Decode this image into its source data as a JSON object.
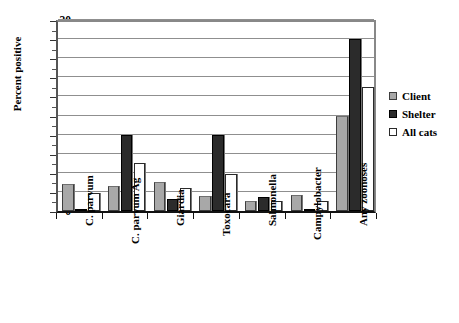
{
  "chart_data": {
    "type": "bar",
    "title": "",
    "subtitle": "",
    "xlabel": "",
    "ylabel": "Percent positive",
    "ylim": [
      0,
      20
    ],
    "ytick_step": 2,
    "yticks": [
      "0",
      "2",
      "4",
      "6",
      "8",
      "10",
      "12",
      "14",
      "16",
      "18",
      "20"
    ],
    "grid": true,
    "legend_position": "right",
    "categories": [
      "C. parvum",
      "C. parvum Ag",
      "Giardia",
      "Toxocara",
      "Salmonella",
      "Campylobacter",
      "Any zoonoses"
    ],
    "series": [
      {
        "name": "Client",
        "color": "#a8a8a8",
        "values": [
          2.8,
          2.6,
          3.0,
          1.6,
          1.0,
          1.7,
          10.0
        ]
      },
      {
        "name": "Shelter",
        "color": "#2b2b2b",
        "values": [
          0.1,
          8.0,
          1.3,
          8.0,
          1.5,
          0.05,
          18.0
        ]
      },
      {
        "name": "All cats",
        "color": "#ffffff",
        "values": [
          1.9,
          5.0,
          2.4,
          3.9,
          1.1,
          1.0,
          13.0
        ]
      }
    ]
  },
  "legend": {
    "items": [
      {
        "label": "Client"
      },
      {
        "label": "Shelter"
      },
      {
        "label": "All cats"
      }
    ]
  },
  "axis": {
    "y_title": "Percent positive"
  }
}
